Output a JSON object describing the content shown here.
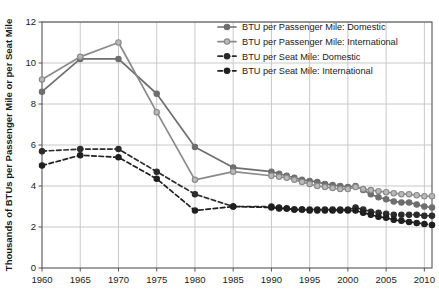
{
  "chart_data": {
    "type": "line",
    "title": "",
    "xlabel": "",
    "ylabel": "Thousands of BTUs per Passenger Mile or per Seat Mile",
    "xlim": [
      1960,
      2011
    ],
    "ylim": [
      0,
      12
    ],
    "yticks": [
      0,
      2,
      4,
      6,
      8,
      10,
      12
    ],
    "xticks": [
      1960,
      1965,
      1970,
      1975,
      1980,
      1985,
      1990,
      1995,
      2000,
      2005,
      2010
    ],
    "grid": true,
    "legend_position": "top-right",
    "series": [
      {
        "name": "BTU per Passenger Mile: Domestic",
        "style": "solid",
        "color": "#6e6e6e",
        "marker": "circle",
        "x": [
          1960,
          1965,
          1970,
          1975,
          1980,
          1985,
          1990,
          1991,
          1992,
          1993,
          1994,
          1995,
          1996,
          1997,
          1998,
          1999,
          2000,
          2001,
          2002,
          2003,
          2004,
          2005,
          2006,
          2007,
          2008,
          2009,
          2010,
          2011
        ],
        "values": [
          8.6,
          10.2,
          10.2,
          8.5,
          5.9,
          4.9,
          4.7,
          4.6,
          4.5,
          4.4,
          4.3,
          4.25,
          4.2,
          4.1,
          4.05,
          4.0,
          3.95,
          4.0,
          3.8,
          3.6,
          3.45,
          3.35,
          3.25,
          3.2,
          3.2,
          3.1,
          3.0,
          2.95
        ]
      },
      {
        "name": "BTU per Passenger Mile: International",
        "style": "solid",
        "color": "#8a8a8a",
        "marker": "circle-open",
        "x": [
          1960,
          1965,
          1970,
          1975,
          1980,
          1985,
          1990,
          1991,
          1992,
          1993,
          1994,
          1995,
          1996,
          1997,
          1998,
          1999,
          2000,
          2001,
          2002,
          2003,
          2004,
          2005,
          2006,
          2007,
          2008,
          2009,
          2010,
          2011
        ],
        "values": [
          9.2,
          10.3,
          11.0,
          7.6,
          4.3,
          4.7,
          4.5,
          4.45,
          4.4,
          4.3,
          4.2,
          4.1,
          4.0,
          3.95,
          3.9,
          3.85,
          3.85,
          3.95,
          3.85,
          3.8,
          3.75,
          3.7,
          3.65,
          3.6,
          3.6,
          3.55,
          3.5,
          3.5
        ]
      },
      {
        "name": "BTU per Seat Mile: Domestic",
        "style": "dashed",
        "color": "#2b2b2b",
        "marker": "circle",
        "x": [
          1960,
          1965,
          1970,
          1975,
          1980,
          1985,
          1990,
          1991,
          1992,
          1993,
          1994,
          1995,
          1996,
          1997,
          1998,
          1999,
          2000,
          2001,
          2002,
          2003,
          2004,
          2005,
          2006,
          2007,
          2008,
          2009,
          2010,
          2011
        ],
        "values": [
          5.7,
          5.8,
          5.8,
          4.7,
          3.6,
          3.0,
          3.0,
          2.95,
          2.9,
          2.85,
          2.85,
          2.85,
          2.85,
          2.85,
          2.85,
          2.85,
          2.85,
          2.95,
          2.85,
          2.75,
          2.7,
          2.65,
          2.6,
          2.6,
          2.6,
          2.6,
          2.55,
          2.55
        ]
      },
      {
        "name": "BTU per Seat Mile: International",
        "style": "dashed",
        "color": "#1f1f1f",
        "marker": "circle",
        "x": [
          1960,
          1965,
          1970,
          1975,
          1980,
          1985,
          1990,
          1991,
          1992,
          1993,
          1994,
          1995,
          1996,
          1997,
          1998,
          1999,
          2000,
          2001,
          2002,
          2003,
          2004,
          2005,
          2006,
          2007,
          2008,
          2009,
          2010,
          2011
        ],
        "values": [
          5.0,
          5.5,
          5.4,
          4.35,
          2.8,
          3.0,
          2.95,
          2.9,
          2.9,
          2.85,
          2.85,
          2.8,
          2.8,
          2.8,
          2.8,
          2.8,
          2.8,
          2.8,
          2.7,
          2.6,
          2.5,
          2.45,
          2.35,
          2.3,
          2.25,
          2.2,
          2.15,
          2.1
        ]
      }
    ]
  },
  "legend": {
    "items": [
      "BTU per Passenger Mile: Domestic",
      "BTU per Passenger Mile: International",
      "BTU per Seat Mile: Domestic",
      "BTU per Seat Mile: International"
    ]
  },
  "colors": {
    "grid": "#c8c8c8",
    "axis": "#555555",
    "background": "#ffffff"
  }
}
